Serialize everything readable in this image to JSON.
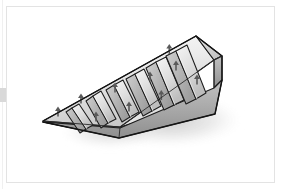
{
  "canvas": {
    "width": 281,
    "height": 189,
    "background_color": "#ffffff",
    "border_color": "#e3e3e3",
    "alt_text": "Isometric CAD rendering of a ribbed wedge ramp"
  },
  "figure": {
    "title": "Ribbed wedge ramp",
    "object_name": "wedge-ramp-with-transverse-ribs",
    "projection": "isometric",
    "shading": "linear gradient grey",
    "outline_color": "#1c1c1c",
    "rib_count": 8,
    "arrow_count": 8,
    "arrow_direction": "up",
    "arrow_color": "#5a5a5a",
    "has_drop_shadow": true,
    "shadow_color": "#c8c8c8"
  },
  "palette": {
    "face_light": "#f2f2f2",
    "face_mid": "#d8d8d8",
    "face_dark": "#b4b4b4",
    "end_block_face": "#a8a8a8",
    "end_block_top": "#cfcfcf",
    "underside": "#9a9a9a",
    "edge_stroke": "#1c1c1c",
    "highlight": "#fbfbfb"
  },
  "geometry": {
    "tip_point": "left",
    "thick_end": "right",
    "ramp_length_px": 175,
    "ramp_height_px": 58,
    "ribs": [
      {
        "index": 1,
        "label": "rib-1",
        "arrow": "up"
      },
      {
        "index": 2,
        "label": "rib-2",
        "arrow": "up"
      },
      {
        "index": 3,
        "label": "rib-3",
        "arrow": "up"
      },
      {
        "index": 4,
        "label": "rib-4",
        "arrow": "up"
      },
      {
        "index": 5,
        "label": "rib-5",
        "arrow": "up"
      },
      {
        "index": 6,
        "label": "rib-6",
        "arrow": "up"
      },
      {
        "index": 7,
        "label": "rib-7",
        "arrow": "up"
      },
      {
        "index": 8,
        "label": "rib-8",
        "arrow": "up"
      }
    ]
  }
}
